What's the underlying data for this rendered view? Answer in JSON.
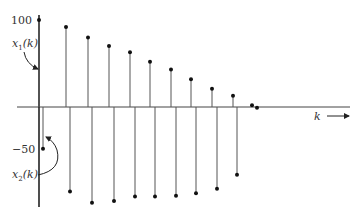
{
  "chart_data": {
    "type": "stem",
    "title": "",
    "xlabel": "k",
    "ylabel": "",
    "series": [
      {
        "name": "x1(k)",
        "k": [
          0,
          1,
          2,
          3,
          4,
          5,
          6,
          7,
          8,
          9,
          10
        ],
        "values": [
          100,
          92,
          80,
          70,
          63,
          52,
          43,
          32,
          21,
          13,
          2
        ]
      },
      {
        "name": "x2(k)",
        "k": [
          0,
          1,
          2,
          3,
          4,
          5,
          6,
          7,
          8,
          9,
          10
        ],
        "values": [
          -48,
          -97,
          -110,
          -108,
          -103,
          -103,
          -102,
          -99,
          -94,
          -78,
          -1
        ]
      }
    ],
    "y_ticks": [
      100,
      -50
    ],
    "y_tick_labels": [
      "100",
      "−50"
    ],
    "annotations": [
      "x1(k)",
      "x2(k)"
    ],
    "grid": false,
    "legend": "none (curved arrows point from labels to series)"
  },
  "labels": {
    "y100": "100",
    "yneg50": "−50",
    "x1_main": "x",
    "x1_sub": "1",
    "x1_arg": "(k)",
    "x2_main": "x",
    "x2_sub": "2",
    "x2_arg": "(k)",
    "k": "k"
  }
}
